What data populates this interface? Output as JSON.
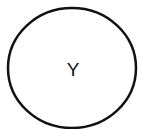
{
  "diagram": {
    "nodes": [
      {
        "id": "Y",
        "label": "Y",
        "shape": "ellipse",
        "stroke": "#111111",
        "fill": "#ffffff"
      }
    ]
  }
}
